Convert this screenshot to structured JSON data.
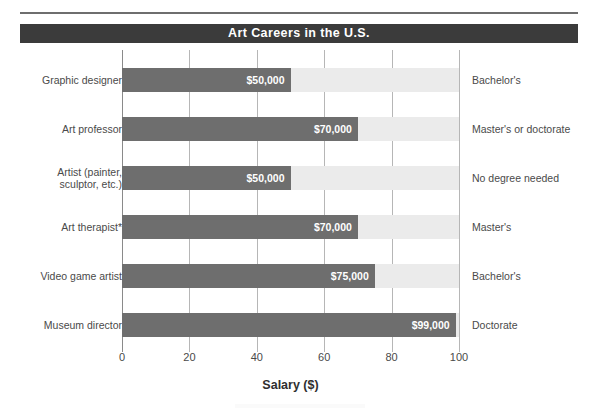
{
  "figure": {
    "title": "Art Careers in the U.S.",
    "axis_title": "Salary ($)"
  },
  "chart_data": {
    "type": "bar",
    "orientation": "horizontal",
    "title": "Art Careers in the U.S.",
    "xlabel": "Salary ($)",
    "ylabel": "",
    "xlim": [
      0,
      100
    ],
    "xticks": [
      0,
      20,
      40,
      60,
      80,
      100
    ],
    "xtick_labels": [
      "0",
      "20",
      "40",
      "60",
      "80",
      "100"
    ],
    "grid": true,
    "legend": "none",
    "units_note": "x-axis is salary in thousands of dollars",
    "categories": [
      "Graphic designer",
      "Art professor",
      "Artist (painter, sculptor, etc.)",
      "Art therapist*",
      "Video game artist",
      "Museum director"
    ],
    "values": [
      50,
      70,
      50,
      70,
      75,
      99
    ],
    "value_labels": [
      "$50,000",
      "$70,000",
      "$50,000",
      "$70,000",
      "$75,000",
      "$99,000"
    ],
    "education_notes": [
      "Bachelor's",
      "Master's or doctorate",
      "No degree needed",
      "Master's",
      "Bachelor's",
      "Doctorate"
    ],
    "colors": {
      "bar": "#6e6e6e",
      "track": "#ebebeb",
      "title_banner": "#3b3b3b",
      "title_text": "#ffffff",
      "gridline": "#b6b6b6",
      "text": "#4a4a4a",
      "background": "#ffffff"
    }
  },
  "rows": [
    {
      "label": "Graphic designer",
      "value": 50,
      "value_label": "$50,000",
      "note": "Bachelor's"
    },
    {
      "label": "Art professor",
      "value": 70,
      "value_label": "$70,000",
      "note": "Master's or doctorate"
    },
    {
      "label": "Artist (painter,\nsculptor, etc.)",
      "value": 50,
      "value_label": "$50,000",
      "note": "No degree needed"
    },
    {
      "label": "Art therapist*",
      "value": 70,
      "value_label": "$70,000",
      "note": "Master's"
    },
    {
      "label": "Video game artist",
      "value": 75,
      "value_label": "$75,000",
      "note": "Bachelor's"
    },
    {
      "label": "Museum director",
      "value": 99,
      "value_label": "$99,000",
      "note": "Doctorate"
    }
  ],
  "x_axis": {
    "ticks": [
      "0",
      "20",
      "40",
      "60",
      "80",
      "100"
    ]
  }
}
